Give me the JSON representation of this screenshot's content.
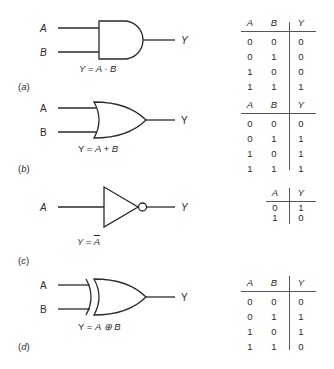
{
  "figure": {
    "gates": [
      {
        "id": "a",
        "type": "AND",
        "caption": "(a)",
        "caption_letter": "a",
        "inputs": [
          "A",
          "B"
        ],
        "output": "Y",
        "equation_left": "Y = ",
        "equation_expr": "A · B",
        "truth_table": {
          "headers": [
            "A",
            "B",
            "Y"
          ],
          "rows": [
            [
              "0",
              "0",
              "0"
            ],
            [
              "0",
              "1",
              "0"
            ],
            [
              "1",
              "0",
              "0"
            ],
            [
              "1",
              "1",
              "1"
            ]
          ]
        }
      },
      {
        "id": "b",
        "type": "OR",
        "caption": "(b)",
        "caption_letter": "b",
        "inputs": [
          "A",
          "B"
        ],
        "output": "Y",
        "equation_left": "Y = ",
        "equation_expr": "A + B",
        "truth_table": {
          "headers": [
            "A",
            "B",
            "Y"
          ],
          "rows": [
            [
              "0",
              "0",
              "0"
            ],
            [
              "0",
              "1",
              "1"
            ],
            [
              "1",
              "0",
              "1"
            ],
            [
              "1",
              "1",
              "1"
            ]
          ]
        }
      },
      {
        "id": "c",
        "type": "NOT",
        "caption": "(c)",
        "caption_letter": "c",
        "inputs": [
          "A"
        ],
        "output": "Y",
        "equation_left": "Y = ",
        "equation_expr": "A",
        "truth_table": {
          "headers": [
            "A",
            "Y"
          ],
          "rows": [
            [
              "0",
              "1"
            ],
            [
              "1",
              "0"
            ]
          ]
        }
      },
      {
        "id": "d",
        "type": "XOR",
        "caption": "(d)",
        "caption_letter": "d",
        "inputs": [
          "A",
          "B"
        ],
        "output": "Y",
        "equation_left": "Y = ",
        "equation_expr": "A ⊕ B",
        "truth_table": {
          "headers": [
            "A",
            "B",
            "Y"
          ],
          "rows": [
            [
              "0",
              "0",
              "0"
            ],
            [
              "0",
              "1",
              "1"
            ],
            [
              "1",
              "0",
              "1"
            ],
            [
              "1",
              "1",
              "0"
            ]
          ]
        }
      }
    ]
  },
  "colors": {
    "ink": "#2a2a2a",
    "background": "#ffffff"
  }
}
